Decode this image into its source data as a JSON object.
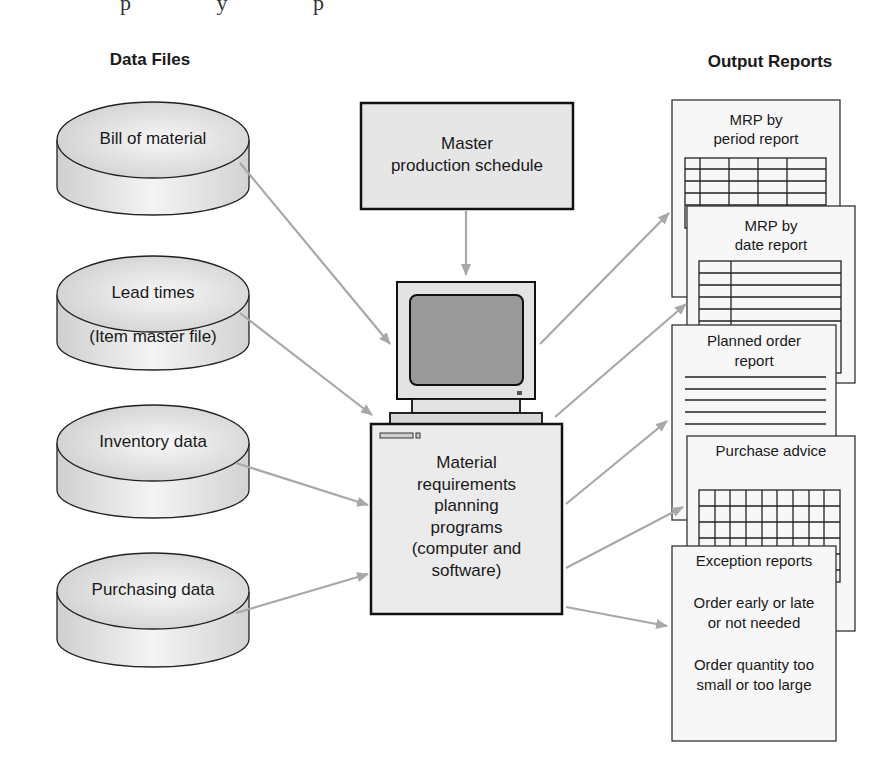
{
  "cropped_top_text": "p y p",
  "headings": {
    "data_files": "Data Files",
    "output_reports": "Output Reports"
  },
  "data_files": [
    {
      "line1": "Bill of material",
      "line2": ""
    },
    {
      "line1": "Lead times",
      "line2": "(Item master file)"
    },
    {
      "line1": "Inventory data",
      "line2": ""
    },
    {
      "line1": "Purchasing data",
      "line2": ""
    }
  ],
  "master_schedule": {
    "line1": "Master",
    "line2": "production schedule"
  },
  "computer": {
    "lines": [
      "Material",
      "requirements",
      "planning",
      "programs",
      "(computer and",
      "software)"
    ]
  },
  "output_reports": [
    {
      "line1": "MRP by",
      "line2": "period report"
    },
    {
      "line1": "MRP by",
      "line2": "date report"
    },
    {
      "line1": "Planned order",
      "line2": "report"
    },
    {
      "line1": "Purchase advice",
      "line2": ""
    },
    {
      "title": "Exception reports",
      "items": [
        "Order early or late",
        "or not needed",
        "Order quantity too",
        "small or too large"
      ]
    }
  ],
  "colors": {
    "arrow": "#a8a8a8",
    "box_fill": "#e6e6e6",
    "screen_fill": "#9a9a9a",
    "outline": "#1a1a1a",
    "paper": "#f7f7f7"
  }
}
